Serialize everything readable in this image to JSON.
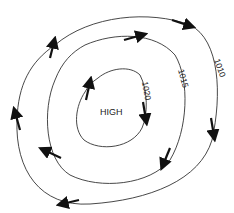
{
  "diagram": {
    "center_label": "HIGH",
    "isobars": [
      {
        "label": "1020",
        "name": "inner"
      },
      {
        "label": "1015",
        "name": "middle"
      },
      {
        "label": "1010",
        "name": "outer"
      }
    ],
    "wind_direction": "clockwise",
    "colors": {
      "line": "#333333",
      "arrow": "#111111",
      "background": "#ffffff"
    }
  }
}
